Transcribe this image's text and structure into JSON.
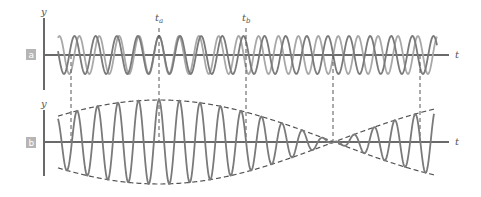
{
  "figure": {
    "panel_a": {
      "badge": "a",
      "y_label": "y",
      "t_label": "t"
    },
    "panel_b": {
      "badge": "b",
      "y_label": "y",
      "t_label": "t"
    },
    "markers": {
      "t_a": "t",
      "t_a_sub": "a",
      "t_b": "t",
      "t_b_sub": "b"
    }
  },
  "chart_data": [
    {
      "type": "line",
      "title": "Two waves of slightly different frequency (superimposed)",
      "panel": "a",
      "xlabel": "t",
      "ylabel": "y",
      "series": [
        {
          "name": "wave 1",
          "color": "#7a7a7a",
          "amplitude": 1,
          "relative_frequency": 0.986
        },
        {
          "name": "wave 2",
          "color": "#a8a8a8",
          "amplitude": 1,
          "relative_frequency": 1.014
        }
      ],
      "annotations": [
        "t_a (waves in phase)",
        "t_b (waves out of phase)"
      ],
      "grid": false
    },
    {
      "type": "line",
      "title": "Resultant wave showing beats",
      "panel": "b",
      "xlabel": "t",
      "ylabel": "y",
      "series": [
        {
          "name": "resultant",
          "color": "#7a7a7a",
          "amplitude": 2
        },
        {
          "name": "envelope",
          "style": "dashed",
          "color": "#555555"
        }
      ],
      "envelope_nodes": 3,
      "envelope_maxima": 2,
      "carrier_cycles_per_beat": 8.5,
      "grid": false
    }
  ],
  "geometry": {
    "axis_x": 44,
    "a": {
      "y0": 55,
      "top": 18,
      "bottom": 90,
      "amp": 19,
      "xstart": 58,
      "xend": 437
    },
    "b": {
      "y0": 142,
      "top": 108,
      "bottom": 176,
      "amp": 42,
      "xstart": 58,
      "xend": 434
    },
    "axis_end": 449,
    "period": 20.5,
    "beat_center": 159,
    "beat_half": 175,
    "guides": [
      71,
      159,
      246,
      333,
      420
    ]
  }
}
